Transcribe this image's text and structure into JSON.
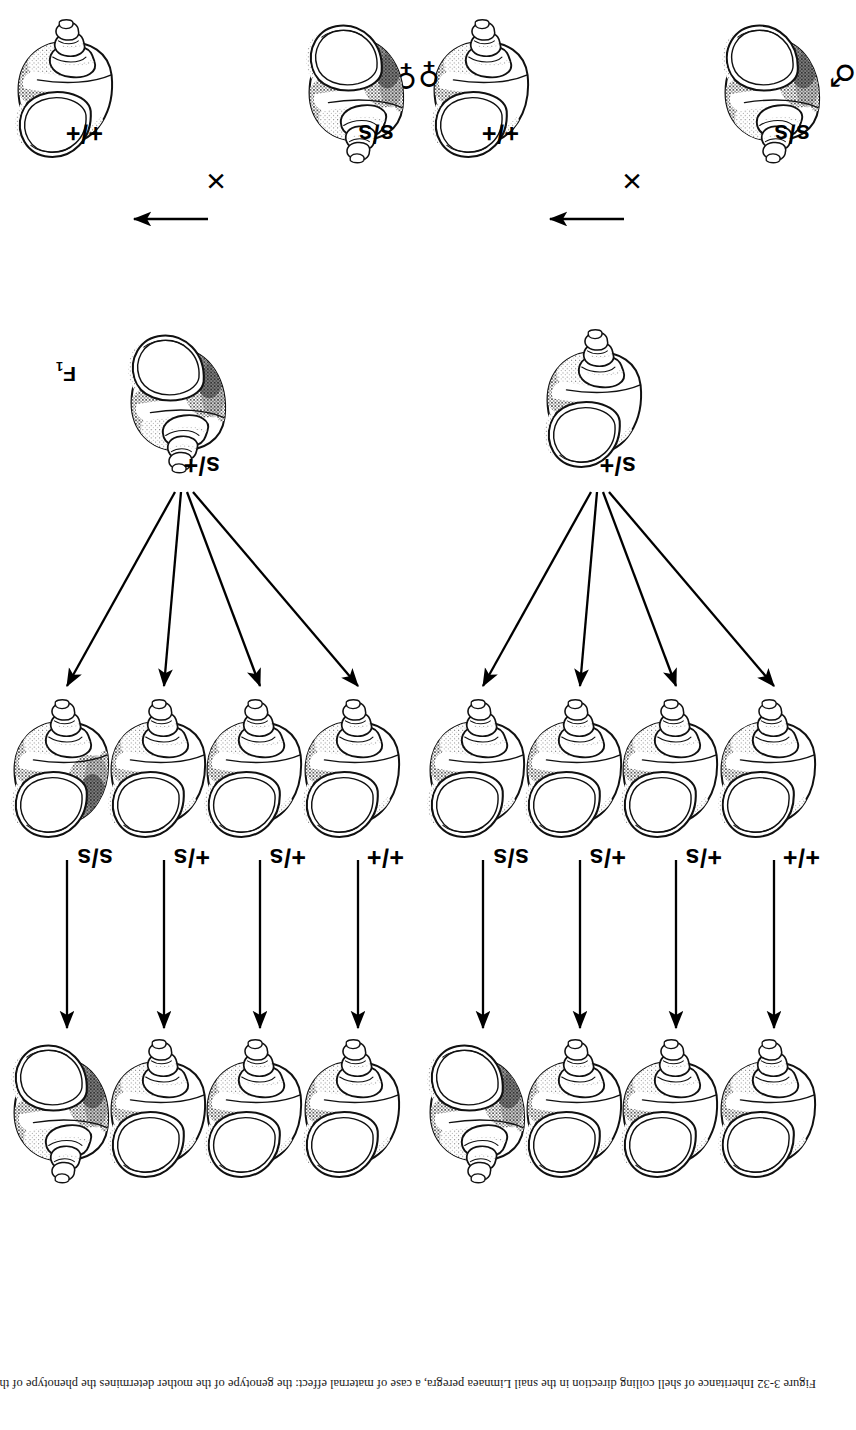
{
  "figure": {
    "background_color": "#ffffff",
    "ink_color": "#000000",
    "caption": "Figure 3-32  Inheritance of shell coiling direction in the snail Limnaea peregra, a case of maternal effect: the genotype of the mother determines the phenotype of the offspring. The dominant allele + gives dextral (right-handed) coiling and s gives sinistral (left-handed) coiling."
  },
  "generations": {
    "labels": [
      {
        "main": "P",
        "sub": ""
      },
      {
        "main": "F",
        "sub": "1"
      },
      {
        "main": "F",
        "sub": "2"
      },
      {
        "main": "F",
        "sub": "3"
      }
    ]
  },
  "symbols": {
    "female": "♀",
    "male": "♂",
    "cross": "×"
  },
  "cross_a": {
    "name": "cross-dextral-mother",
    "parents": [
      {
        "sex_symbol": "♀",
        "genotype": "+/+",
        "coiling": "dextral"
      },
      {
        "sex_symbol": "♂",
        "genotype": "s/s",
        "coiling": "sinistral"
      }
    ],
    "f1": {
      "genotype": "s/+",
      "coiling": "dextral"
    },
    "f2": [
      {
        "genotype": "+/+",
        "coiling": "dextral"
      },
      {
        "genotype": "+/s",
        "coiling": "dextral"
      },
      {
        "genotype": "+/s",
        "coiling": "dextral"
      },
      {
        "genotype": "s/s",
        "coiling": "dextral"
      }
    ],
    "f3": [
      {
        "genotype": "+/+",
        "coiling": "dextral"
      },
      {
        "genotype": "+/s",
        "coiling": "dextral"
      },
      {
        "genotype": "+/s",
        "coiling": "dextral"
      },
      {
        "genotype": "s/s",
        "coiling": "sinistral"
      }
    ]
  },
  "cross_b": {
    "name": "cross-sinistral-mother",
    "parents": [
      {
        "sex_symbol": "♂",
        "genotype": "+/+",
        "coiling": "dextral"
      },
      {
        "sex_symbol": "♀",
        "genotype": "s/s",
        "coiling": "sinistral"
      }
    ],
    "f1": {
      "genotype": "s/+",
      "coiling": "sinistral"
    },
    "f2": [
      {
        "genotype": "+/+",
        "coiling": "dextral"
      },
      {
        "genotype": "+/s",
        "coiling": "dextral"
      },
      {
        "genotype": "+/s",
        "coiling": "dextral"
      },
      {
        "genotype": "s/s",
        "coiling": "dextral"
      }
    ],
    "f3": [
      {
        "genotype": "+/+",
        "coiling": "dextral"
      },
      {
        "genotype": "+/s",
        "coiling": "dextral"
      },
      {
        "genotype": "+/s",
        "coiling": "dextral"
      },
      {
        "genotype": "s/s",
        "coiling": "sinistral"
      }
    ]
  }
}
